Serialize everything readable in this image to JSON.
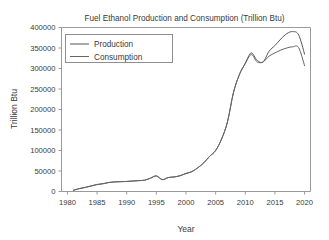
{
  "chart_data": {
    "type": "line",
    "title": "Fuel Ethanol Production and Consumption (Trillion Btu)",
    "xlabel": "Year",
    "ylabel": "Trillion Btu",
    "xlim": [
      1979,
      2021
    ],
    "ylim": [
      0,
      400000
    ],
    "grid": false,
    "legend_position": "upper left",
    "xticks": [
      1980,
      1985,
      1990,
      1995,
      2000,
      2005,
      2010,
      2015,
      2020
    ],
    "xtick_labels": [
      "1980",
      "1985",
      "1990",
      "1995",
      "2000",
      "2005",
      "2010",
      "2015",
      "2020"
    ],
    "yticks": [
      0,
      50000,
      100000,
      150000,
      200000,
      250000,
      300000,
      350000,
      400000
    ],
    "ytick_labels": [
      "0",
      "50000",
      "100000",
      "150000",
      "200000",
      "250000",
      "300000",
      "350000",
      "400000"
    ],
    "x": [
      1981,
      1982,
      1983,
      1984,
      1985,
      1986,
      1987,
      1988,
      1989,
      1990,
      1991,
      1992,
      1993,
      1994,
      1995,
      1996,
      1997,
      1998,
      1999,
      2000,
      2001,
      2002,
      2003,
      2004,
      2005,
      2006,
      2007,
      2008,
      2009,
      2010,
      2011,
      2012,
      2013,
      2014,
      2015,
      2016,
      2017,
      2018,
      2019,
      2020
    ],
    "series": [
      {
        "name": "Production",
        "color": "#555555",
        "values": [
          3000,
          7000,
          10000,
          13500,
          17000,
          19000,
          22000,
          23500,
          24000,
          24500,
          25500,
          26500,
          27500,
          32500,
          38000,
          29000,
          34000,
          35500,
          38500,
          44000,
          48500,
          58000,
          70000,
          86000,
          100000,
          128000,
          170000,
          241000,
          285000,
          313000,
          338000,
          320000,
          316000,
          342000,
          356000,
          372000,
          385000,
          390000,
          382000,
          335000
        ]
      },
      {
        "name": "Consumption",
        "color": "#666666",
        "values": [
          3000,
          7000,
          10000,
          13500,
          17000,
          19000,
          22000,
          23500,
          24000,
          24500,
          25500,
          26500,
          27500,
          32500,
          38000,
          29000,
          34000,
          35500,
          38500,
          44000,
          48500,
          58000,
          70000,
          86000,
          100000,
          128000,
          170000,
          241000,
          285000,
          312000,
          334000,
          316000,
          316000,
          330000,
          338000,
          345000,
          350000,
          353000,
          351000,
          307000
        ]
      }
    ]
  },
  "legend": {
    "entries": [
      "Production",
      "Consumption"
    ]
  }
}
